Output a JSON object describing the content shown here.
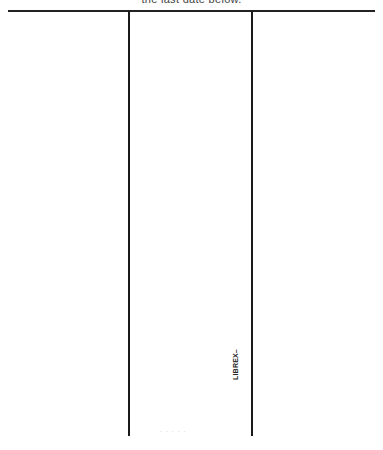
{
  "document": {
    "header_text": "the last date below.",
    "columns": [
      "",
      "",
      ""
    ],
    "vertical_stamp": "LIBREX–",
    "footer_faint_text": ". . . . ."
  }
}
